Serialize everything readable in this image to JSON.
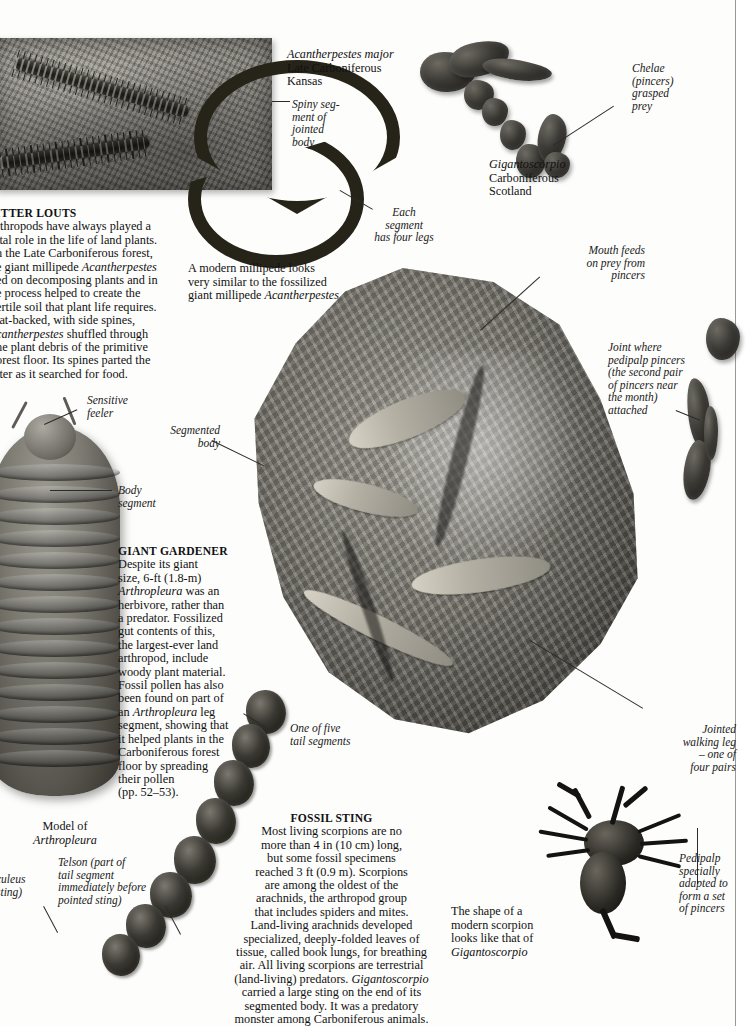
{
  "page": {
    "type": "book-spread-scan"
  },
  "articles": {
    "litter_louts": {
      "heading": "LITTER LOUTS",
      "heading_visible": "ITTER LOUTS",
      "lines": [
        "rthropods have always played a",
        "ital role in the life of land plants.",
        "n the Late Carboniferous forest,",
        "e giant millipede Acantherpestes",
        "ed on decomposing plants and in",
        "e process helped to create the",
        "ertile soil that plant life requires.",
        "lat-backed, with side spines,",
        "cantherpestes shuffled through",
        "he plant debris of the primitive",
        "orest floor. Its spines parted the",
        "tter as it searched for food."
      ]
    },
    "giant_gardener": {
      "heading": "GIANT GARDENER",
      "lines": [
        "Despite its giant",
        "size, 6-ft (1.8-m)",
        "Arthropleura was an",
        "herbivore, rather than",
        "a predator. Fossilized",
        "gut contents of this,",
        "the largest-ever land",
        "arthropod, include",
        "woody plant material.",
        "Fossil pollen has also",
        "been found on part of",
        "an Arthropleura leg",
        "segment, showing that",
        "it helped plants in the",
        "Carboniferous forest",
        "floor by spreading",
        "their pollen",
        "(pp. 52–53)."
      ]
    },
    "fossil_sting": {
      "heading": "FOSSIL STING",
      "lines": [
        "Most living scorpions are no",
        "more than 4 in (10 cm) long,",
        "but some fossil specimens",
        "reached 3 ft (0.9 m). Scorpions",
        "are among the oldest of the",
        "arachnids, the arthropod group",
        "that includes spiders and mites.",
        "Land-living arachnids developed",
        "specialized, deeply-folded leaves of",
        "tissue, called book lungs, for breathing",
        "air. All living scorpions are terrestrial",
        "(land-living) predators. Gigantoscorpio",
        "carried a large sting on the end of its",
        "segmented body.  It was a predatory",
        "monster among Carboniferous animals."
      ]
    }
  },
  "specimen_labels": {
    "acantherpestes": [
      "Acantherpestes major",
      "Late Carboniferous",
      "Kansas"
    ],
    "gigantoscorpio": [
      "Gigantoscorpio",
      "Carboniferous",
      "Scotland"
    ],
    "model_of_arthropleura": [
      "Model of",
      "Arthropleura"
    ],
    "modern_millipede_note": [
      "A modern millipede looks",
      "very similar to the fossilized",
      "giant millipede Acantherpestes"
    ],
    "modern_scorpion_note": [
      "The shape of a",
      "modern scorpion",
      "looks like that of",
      "Gigantoscorpio"
    ]
  },
  "callouts": {
    "spiny_segment": [
      "Spiny seg-",
      "ment of",
      "jointed",
      "body"
    ],
    "each_segment": [
      "Each",
      "segment",
      "has four legs"
    ],
    "chelae": [
      "Chelae",
      "(pincers)",
      "grasped",
      "prey"
    ],
    "mouth_feeds": [
      "Mouth feeds",
      "on prey from",
      "pincers"
    ],
    "joint_where": [
      "Joint where",
      "pedipalp pincers",
      "(the second pair",
      "of pincers near",
      "the month)",
      "attached"
    ],
    "jointed_walking_leg": [
      "Jointed",
      "walking leg",
      "– one of",
      "four pairs"
    ],
    "pedipalp": [
      "Pedipalp",
      "specially",
      "adapted to",
      "form a set",
      "of pincers"
    ],
    "sensitive_feeler": [
      "Sensitive",
      "feeler"
    ],
    "body_segment": [
      "Body",
      "segment"
    ],
    "segmented_body": [
      "Segmented",
      "body"
    ],
    "one_of_five": [
      "One of five",
      "tail segments"
    ],
    "telson": [
      "Telson (part of",
      "tail segment",
      "immediately before",
      "pointed sting)"
    ],
    "aculeus": [
      "culeus",
      "sting)"
    ]
  },
  "colors": {
    "paper": "#fdfdfc",
    "ink": "#111111",
    "rule": "#9a9a95",
    "fossil_dark": "#14130f",
    "fossil_mid": "#7e7b73",
    "fossil_light": "#a9a69e"
  }
}
